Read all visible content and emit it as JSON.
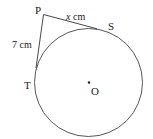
{
  "diagram": {
    "type": "geometry",
    "points": {
      "P": {
        "label": "P"
      },
      "S": {
        "label": "S"
      },
      "T": {
        "label": "T"
      },
      "O": {
        "label": "O"
      }
    },
    "segments": {
      "PT": {
        "label": "7 cm"
      },
      "PS": {
        "label_var": "x",
        "label_unit": " cm"
      }
    },
    "colors": {
      "stroke": "#333333",
      "text": "#222222",
      "background": "#ffffff"
    }
  }
}
